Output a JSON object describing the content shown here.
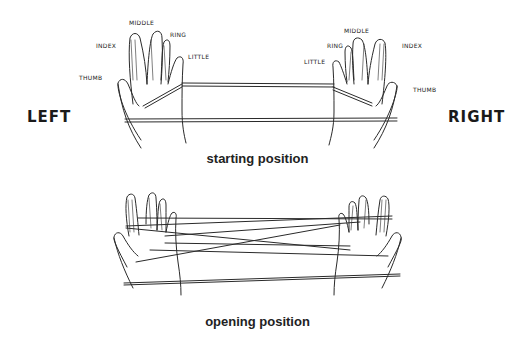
{
  "figure": {
    "side_labels": {
      "left": "LEFT",
      "right": "RIGHT"
    },
    "left_hand_fingers": {
      "thumb": "THUMB",
      "index": "INDEX",
      "middle": "MIDDLE",
      "ring": "RING",
      "little": "LITTLE"
    },
    "right_hand_fingers": {
      "thumb": "THUMB",
      "index": "INDEX",
      "middle": "MIDDLE",
      "ring": "RING",
      "little": "LITTLE"
    },
    "captions": {
      "top": "starting position",
      "bottom": "opening position"
    }
  }
}
